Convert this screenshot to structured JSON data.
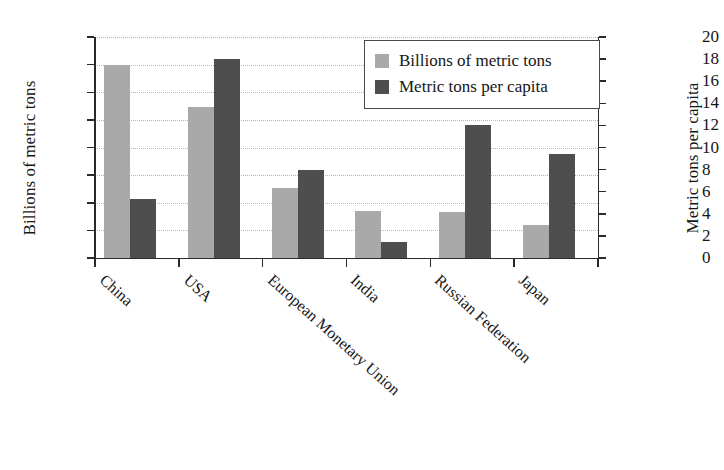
{
  "chart_data": {
    "type": "bar",
    "title": "",
    "categories": [
      "China",
      "USA",
      "European Monetary Union",
      "India",
      "Russian Federation",
      "Japan"
    ],
    "series": [
      {
        "name": "Billions of metric tons",
        "axis": "left",
        "color": "#a9a9a9",
        "values": [
          7.0,
          5.45,
          2.55,
          1.72,
          1.67,
          1.18
        ]
      },
      {
        "name": "Metric tons per capita",
        "axis": "right",
        "color": "#4e4e4e",
        "values": [
          5.3,
          18.0,
          8.0,
          1.45,
          12.0,
          9.4
        ]
      }
    ],
    "xlabel": "",
    "ylabel": "Billions of metric tons",
    "ylabel_right": "Metric tons per capita",
    "ylim": [
      0,
      8
    ],
    "ylim_right": [
      0,
      20
    ],
    "yticks": [
      0,
      1,
      2,
      3,
      4,
      5,
      6,
      7,
      8
    ],
    "yticks_right": [
      0,
      2,
      4,
      6,
      8,
      10,
      12,
      14,
      16,
      18,
      20
    ],
    "grid": true,
    "grid_style": "dotted",
    "legend_position": "top-right",
    "legend_entries": [
      "Billions of metric tons",
      "Metric tons per capita"
    ]
  },
  "axes": {
    "left_title": "Billions of metric tons",
    "right_title": "Metric tons per capita"
  },
  "legend": {
    "items": [
      {
        "label": "Billions of metric tons",
        "color": "#a9a9a9"
      },
      {
        "label": "Metric tons per capita",
        "color": "#4e4e4e"
      }
    ]
  },
  "colors": {
    "series_light": "#a9a9a9",
    "series_dark": "#4e4e4e",
    "axis": "#2a2a2a",
    "grid": "#b6b6b6",
    "background": "#ffffff"
  }
}
